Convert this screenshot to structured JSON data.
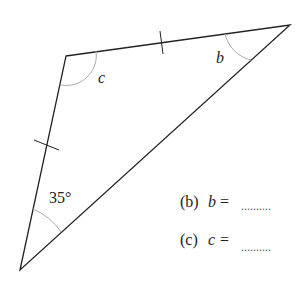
{
  "diagram": {
    "vertices": {
      "top_left": [
        66,
        56
      ],
      "top_right": [
        290,
        25
      ],
      "bottom": [
        20,
        270
      ]
    },
    "angle_labels": {
      "c": "c",
      "b": "b",
      "bottom": "35°"
    },
    "equal_side_ticks": 2
  },
  "questions": [
    {
      "part": "(b)",
      "var": "b",
      "eq": "=",
      "blank": ".........."
    },
    {
      "part": "(c)",
      "var": "c",
      "eq": "=",
      "blank": ".........."
    }
  ]
}
